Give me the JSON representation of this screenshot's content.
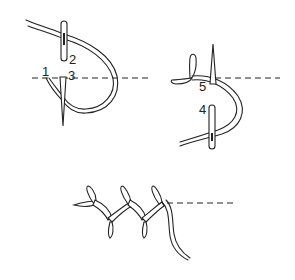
{
  "figure": {
    "colors": {
      "line": "#222222",
      "background": "#ffffff"
    },
    "panels": [
      {
        "id": "step-a",
        "labels": [
          "1",
          "2",
          "3"
        ]
      },
      {
        "id": "step-b",
        "labels": [
          "4",
          "5"
        ]
      },
      {
        "id": "finished-stitch",
        "labels": []
      }
    ]
  }
}
